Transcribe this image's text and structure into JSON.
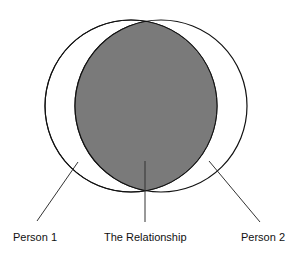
{
  "diagram": {
    "type": "venn",
    "labels": {
      "person1": "Person 1",
      "relationship": "The Relationship",
      "person2": "Person 2"
    },
    "colors": {
      "overlap_fill": "#7a7a7a",
      "stroke": "#111111",
      "background": "#ffffff"
    }
  }
}
